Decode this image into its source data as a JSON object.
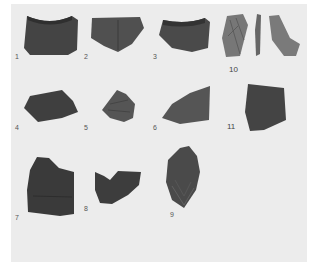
{
  "figure": {
    "background_color": "#ececec",
    "sherd_color": "#4a4a4a",
    "labels": [
      {
        "id": "1",
        "text": "1"
      },
      {
        "id": "2",
        "text": "2"
      },
      {
        "id": "3",
        "text": "3"
      },
      {
        "id": "4",
        "text": "4"
      },
      {
        "id": "5",
        "text": "5"
      },
      {
        "id": "6",
        "text": "6"
      },
      {
        "id": "7",
        "text": "7"
      },
      {
        "id": "8",
        "text": "8"
      },
      {
        "id": "9",
        "text": "9"
      },
      {
        "id": "10",
        "text": "10"
      },
      {
        "id": "11",
        "text": "11"
      }
    ]
  }
}
